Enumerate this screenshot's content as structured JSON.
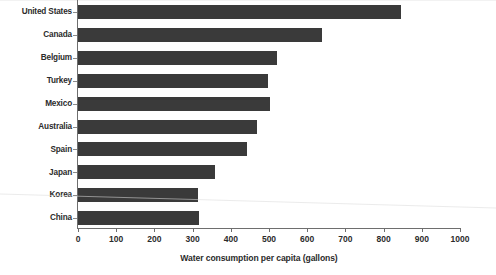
{
  "chart_data": {
    "type": "bar",
    "orientation": "horizontal",
    "title": "",
    "xlabel": "Water consumption per capita (gallons)",
    "ylabel": "",
    "categories": [
      "United States",
      "Canada",
      "Belgium",
      "Turkey",
      "Mexico",
      "Australia",
      "Spain",
      "Japan",
      "Korea",
      "China"
    ],
    "values": [
      845,
      640,
      520,
      498,
      503,
      468,
      442,
      358,
      314,
      317
    ],
    "xlim": [
      0,
      1000
    ],
    "xticks": [
      0,
      100,
      200,
      300,
      400,
      500,
      600,
      700,
      800,
      900,
      1000
    ],
    "xtick_labels": [
      "0",
      "100",
      "200",
      "300",
      "400",
      "500",
      "600",
      "700",
      "800",
      "900",
      "1000"
    ],
    "grid": false,
    "legend": false,
    "bar_color": "#3a3a3a",
    "axis_color": "#6e6e6e",
    "text_color": "#2b2b2b"
  },
  "axis": {
    "x_title": "Water consumption per capita (gallons)"
  }
}
